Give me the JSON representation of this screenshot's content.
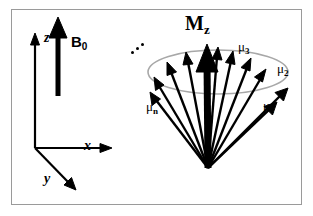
{
  "figure": {
    "background_color": "#ffffff",
    "frame_color": "#9a9a9a",
    "ink_color": "#000000",
    "cone_outline_color": "#a8a8a8",
    "width": 313,
    "height": 216
  },
  "coordinate_frame": {
    "name": "laboratory-frame",
    "axes": [
      {
        "id": "z",
        "label": "z",
        "direction": "up",
        "label_x": 44,
        "label_y": 38
      },
      {
        "id": "x",
        "label": "x",
        "direction": "right",
        "label_x": 85,
        "label_y": 140
      },
      {
        "id": "y",
        "label": "y",
        "direction": "down-left-front",
        "label_x": 45,
        "label_y": 178
      }
    ],
    "origin": {
      "x": 35,
      "y": 148
    }
  },
  "field": {
    "label": "B",
    "subscript": "0",
    "description": "Static magnetic field vector, bold arrow along +z",
    "label_x": 71,
    "label_y": 42,
    "arrow_from": {
      "x": 58,
      "y": 96
    },
    "arrow_to": {
      "x": 58,
      "y": 20
    }
  },
  "magnetization": {
    "label": "M",
    "subscript": "z",
    "description": "Net longitudinal magnetization, thick arrow along cone axis",
    "label_x": 185,
    "label_y": 17,
    "arrow_from": {
      "x": 208,
      "y": 168
    },
    "arrow_to": {
      "x": 207,
      "y": 47
    }
  },
  "cone": {
    "name": "precession-cone",
    "apex": {
      "x": 208,
      "y": 168
    },
    "ellipse": {
      "cx": 218,
      "cy": 72,
      "rx": 70,
      "ry": 22
    },
    "moment_count_drawn": 10,
    "ellipsis": {
      "label": "...",
      "meaning": "additional moments omitted",
      "x": 133,
      "y": 44
    },
    "moment_labels": [
      {
        "id": "mu1",
        "symbol": "μ",
        "subscript": "1",
        "label_x": 263,
        "label_y": 105
      },
      {
        "id": "mu2",
        "symbol": "μ",
        "subscript": "2",
        "label_x": 277,
        "label_y": 68
      },
      {
        "id": "mu3",
        "symbol": "μ",
        "subscript": "3",
        "label_x": 238,
        "label_y": 46
      },
      {
        "id": "mun",
        "symbol": "μ",
        "subscript": "n",
        "label_x": 146,
        "label_y": 106
      }
    ],
    "moment_vectors": [
      {
        "id": "m1",
        "tip_x": 286,
        "tip_y": 90
      },
      {
        "id": "m2",
        "tip_x": 265,
        "tip_y": 72
      },
      {
        "id": "m3",
        "tip_x": 234,
        "tip_y": 55
      },
      {
        "id": "m4",
        "tip_x": 251,
        "tip_y": 62
      },
      {
        "id": "m5",
        "tip_x": 216,
        "tip_y": 51
      },
      {
        "id": "m6",
        "tip_x": 186,
        "tip_y": 56
      },
      {
        "id": "m7",
        "tip_x": 168,
        "tip_y": 66
      },
      {
        "id": "m8",
        "tip_x": 155,
        "tip_y": 80
      },
      {
        "id": "m9",
        "tip_x": 150,
        "tip_y": 95
      },
      {
        "id": "m10",
        "tip_x": 274,
        "tip_y": 104
      }
    ]
  }
}
